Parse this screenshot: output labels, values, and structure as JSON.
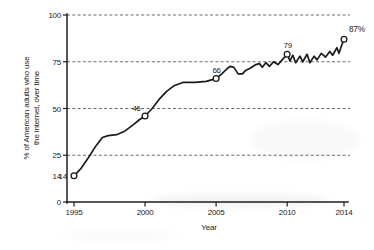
{
  "chart_data": {
    "type": "line",
    "title": "",
    "xlabel": "Year",
    "ylabel_line1": "% of American adults who use",
    "ylabel_line2": "the internet, over time",
    "xlim": [
      1994.4,
      2014.7
    ],
    "ylim": [
      0,
      100
    ],
    "grid": "horizontal dashed gridlines at 25, 50, 75, 100",
    "legend": "none",
    "xticks": [
      1995,
      2000,
      2005,
      2010,
      2014
    ],
    "xtick_labels": [
      "1995",
      "2000",
      "2005",
      "2010",
      "2014"
    ],
    "yticks": [
      0,
      25,
      50,
      75,
      100
    ],
    "ytick_labels": [
      "0",
      "25",
      "50",
      "75",
      "100"
    ],
    "extra_ytick_labels": [
      {
        "value": 14,
        "label": "14"
      }
    ],
    "colors": {
      "line": "#1b1b1b",
      "axis": "#1e1e1e",
      "grid": "#585858",
      "marker_fill": "#ffffff",
      "background": "#ffffff"
    },
    "annotations": [
      {
        "x": 1995,
        "y": 14,
        "label": "14",
        "pos": "left"
      },
      {
        "x": 2000,
        "y": 46,
        "label": "46",
        "pos": "upper-left"
      },
      {
        "x": 2005,
        "y": 66,
        "label": "66",
        "pos": "above"
      },
      {
        "x": 2010,
        "y": 79,
        "label": "79",
        "pos": "above"
      },
      {
        "x": 2014,
        "y": 87,
        "label": "87%",
        "pos": "upper-right"
      }
    ],
    "markers": [
      {
        "x": 1995,
        "y": 14
      },
      {
        "x": 2000,
        "y": 46
      },
      {
        "x": 2005,
        "y": 66
      },
      {
        "x": 2010,
        "y": 79
      },
      {
        "x": 2014,
        "y": 87
      }
    ],
    "series": [
      {
        "name": "% of American adults who use the internet",
        "points": [
          [
            1995.0,
            14
          ],
          [
            1995.5,
            18
          ],
          [
            1996.0,
            23.5
          ],
          [
            1996.5,
            29.5
          ],
          [
            1997.0,
            34.5
          ],
          [
            1997.4,
            35.5
          ],
          [
            1998.0,
            36
          ],
          [
            1998.6,
            38
          ],
          [
            1999.2,
            41.5
          ],
          [
            1999.6,
            44
          ],
          [
            2000.0,
            46
          ],
          [
            2000.5,
            50
          ],
          [
            2001.0,
            55
          ],
          [
            2001.5,
            59
          ],
          [
            2002.0,
            62
          ],
          [
            2002.7,
            64
          ],
          [
            2003.5,
            64
          ],
          [
            2004.3,
            64.5
          ],
          [
            2005.0,
            66
          ],
          [
            2005.4,
            68.5
          ],
          [
            2005.8,
            71.5
          ],
          [
            2006.0,
            72.5
          ],
          [
            2006.25,
            72
          ],
          [
            2006.55,
            68.5
          ],
          [
            2006.85,
            68.5
          ],
          [
            2007.1,
            70.5
          ],
          [
            2007.4,
            71.5
          ],
          [
            2007.8,
            73.5
          ],
          [
            2008.05,
            74
          ],
          [
            2008.25,
            72
          ],
          [
            2008.5,
            74.5
          ],
          [
            2008.75,
            72.5
          ],
          [
            2009.05,
            75
          ],
          [
            2009.35,
            73.5
          ],
          [
            2009.65,
            76
          ],
          [
            2010.0,
            79
          ],
          [
            2010.2,
            75.5
          ],
          [
            2010.4,
            78.5
          ],
          [
            2010.6,
            74.5
          ],
          [
            2010.9,
            78
          ],
          [
            2011.1,
            75
          ],
          [
            2011.4,
            79
          ],
          [
            2011.6,
            74.5
          ],
          [
            2011.9,
            78
          ],
          [
            2012.1,
            76
          ],
          [
            2012.4,
            79.5
          ],
          [
            2012.7,
            77.5
          ],
          [
            2013.0,
            80.5
          ],
          [
            2013.2,
            78.5
          ],
          [
            2013.5,
            82.5
          ],
          [
            2013.65,
            79.5
          ],
          [
            2013.8,
            83
          ],
          [
            2014.0,
            87
          ]
        ]
      }
    ]
  }
}
